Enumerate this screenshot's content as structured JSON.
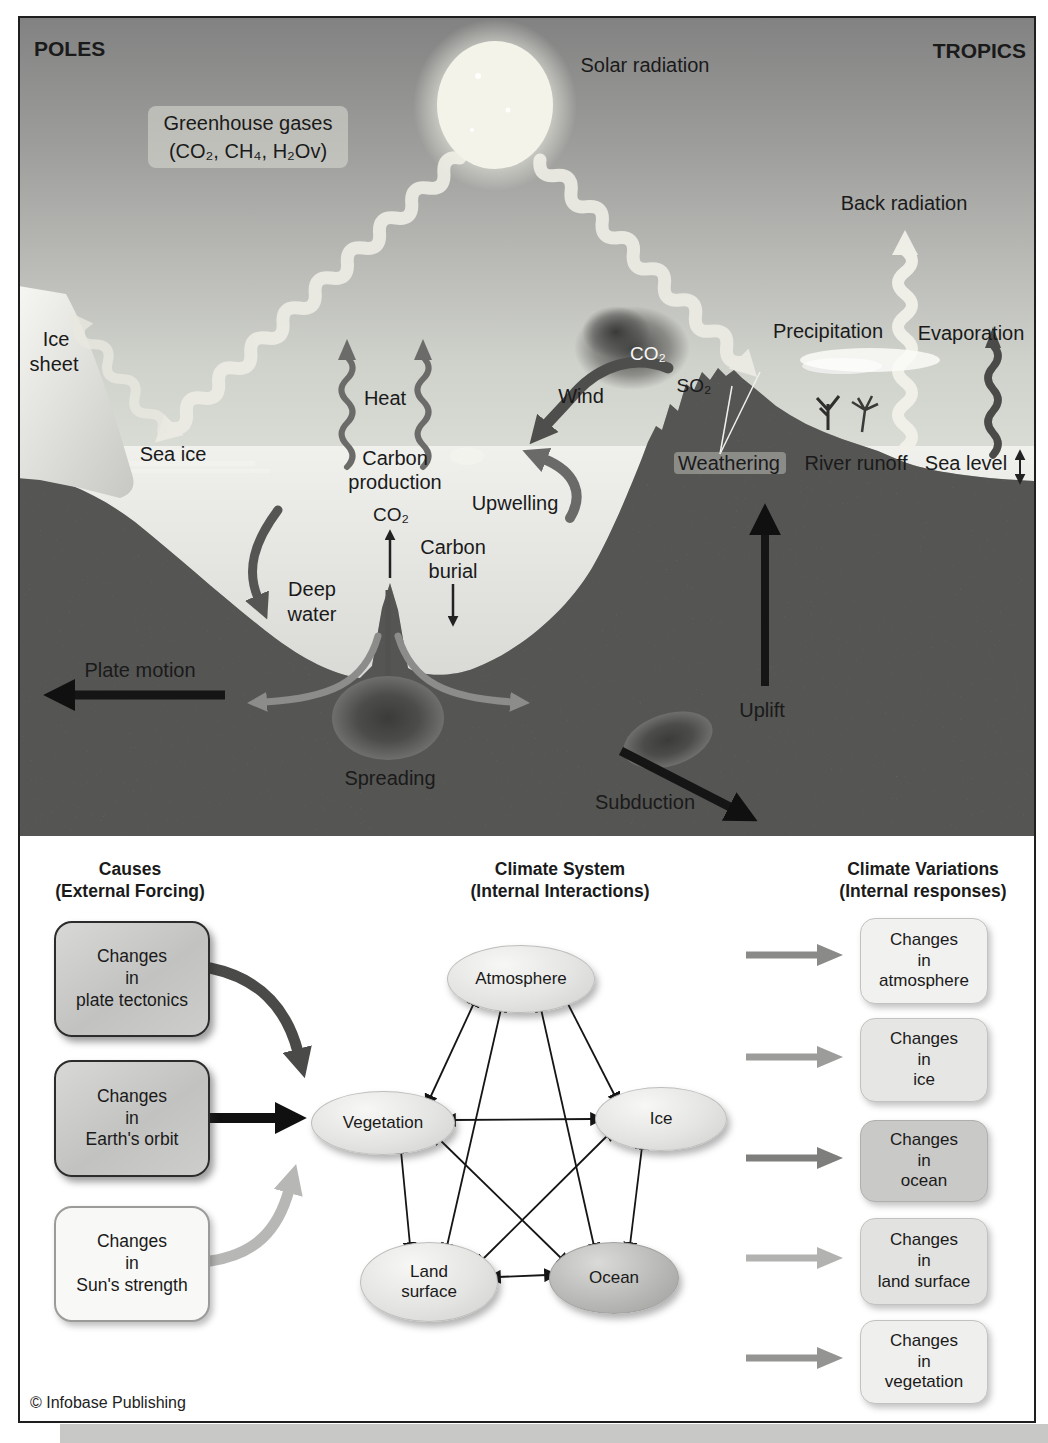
{
  "scene": {
    "poles": "POLES",
    "tropics": "TROPICS",
    "solar_radiation": "Solar radiation",
    "greenhouse_title": "Greenhouse gases",
    "greenhouse_formula": "(CO₂, CH₄, H₂Ov)",
    "back_radiation": "Back radiation",
    "ice_sheet_l1": "Ice",
    "ice_sheet_l2": "sheet",
    "sea_ice": "Sea ice",
    "heat": "Heat",
    "wind": "Wind",
    "co2_volcano": "CO₂",
    "so2": "SO₂",
    "carbon_production_l1": "Carbon",
    "carbon_production_l2": "production",
    "upwelling": "Upwelling",
    "weathering": "Weathering",
    "river_runoff": "River runoff",
    "sea_level": "Sea level",
    "precipitation": "Precipitation",
    "evaporation": "Evaporation",
    "co2_ocean": "CO₂",
    "carbon_burial_l1": "Carbon",
    "carbon_burial_l2": "burial",
    "deep_water_l1": "Deep",
    "deep_water_l2": "water",
    "plate_motion": "Plate motion",
    "uplift": "Uplift",
    "spreading": "Spreading",
    "subduction": "Subduction"
  },
  "flowchart": {
    "headings": [
      {
        "title": "Causes",
        "subtitle": "(External Forcing)"
      },
      {
        "title": "Climate System",
        "subtitle": "(Internal Interactions)"
      },
      {
        "title": "Climate Variations",
        "subtitle": "(Internal responses)"
      }
    ],
    "causes": [
      {
        "l1": "Changes",
        "l2": "in",
        "l3": "plate tectonics"
      },
      {
        "l1": "Changes",
        "l2": "in",
        "l3": "Earth's orbit"
      },
      {
        "l1": "Changes",
        "l2": "in",
        "l3": "Sun's strength"
      }
    ],
    "nodes": [
      {
        "l1": "Atmosphere"
      },
      {
        "l1": "Vegetation"
      },
      {
        "l1": "Ice"
      },
      {
        "l1": "Land",
        "l2": "surface"
      },
      {
        "l1": "Ocean"
      }
    ],
    "responses": [
      {
        "l1": "Changes",
        "l2": "in",
        "l3": "atmosphere"
      },
      {
        "l1": "Changes",
        "l2": "in",
        "l3": "ice"
      },
      {
        "l1": "Changes",
        "l2": "in",
        "l3": "ocean"
      },
      {
        "l1": "Changes",
        "l2": "in",
        "l3": "land surface"
      },
      {
        "l1": "Changes",
        "l2": "in",
        "l3": "vegetation"
      }
    ]
  },
  "credit": "© Infobase Publishing",
  "colors": {
    "sky_top": "#828282",
    "sky_horizon": "#dadcd6",
    "sea_water": "#eff0ec",
    "crust": "#6f6f6d",
    "ice_sheet": "#f2f2ee",
    "sun": "#f3f3ea",
    "solar_ray": "#edece4",
    "arrow_black": "#151515",
    "arrow_dark_gray": "#4a4a48",
    "arrow_mid_gray": "#8c8c8a",
    "arrow_light_gray": "#b7b7b5",
    "cause_box_gray": "#c9c9c7",
    "cause_box_white": "#f8f8f6",
    "node_light": "#e9e9e7",
    "node_ocean": "#b5b5b3",
    "page_strip": "#c8c8c6"
  }
}
